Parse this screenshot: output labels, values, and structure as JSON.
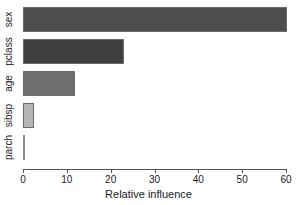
{
  "chart_data": {
    "type": "bar",
    "orientation": "horizontal",
    "title": "",
    "xlabel": "Relative influence",
    "ylabel": "",
    "categories": [
      "sex",
      "pclass",
      "age",
      "sibsp",
      "parch"
    ],
    "values": [
      60.3,
      23.0,
      11.9,
      2.5,
      0.3
    ],
    "series": [
      {
        "name": "Relative influence",
        "values": [
          60.3,
          23.0,
          11.9,
          2.5,
          0.3
        ]
      }
    ],
    "bar_colors": [
      "#4d4d4d",
      "#3f3f3f",
      "#6e6e6e",
      "#b5b5b5",
      "#8a8a8a"
    ],
    "bar_border_color": "#6b6b6b",
    "xlim": [
      0,
      60
    ],
    "xticks": [
      0,
      10,
      20,
      30,
      40,
      50,
      60
    ],
    "xtick_labels": [
      "0",
      "10",
      "20",
      "30",
      "40",
      "50",
      "60"
    ],
    "grid": false,
    "legend": false,
    "legend_position": "none",
    "background_color": "#ffffff",
    "axis_color": "#555555",
    "text_color": "#1a1a1a"
  },
  "axis": {
    "x_title": "Relative influence"
  },
  "bars": [
    {
      "label": "sex",
      "value": 60.3,
      "color": "#4d4d4d"
    },
    {
      "label": "pclass",
      "value": 23.0,
      "color": "#3f3f3f"
    },
    {
      "label": "age",
      "value": 11.9,
      "color": "#6e6e6e"
    },
    {
      "label": "sibsp",
      "value": 2.5,
      "color": "#b5b5b5"
    },
    {
      "label": "parch",
      "value": 0.3,
      "color": "#8a8a8a"
    }
  ],
  "ticks": [
    {
      "label": "0",
      "value": 0
    },
    {
      "label": "10",
      "value": 10
    },
    {
      "label": "20",
      "value": 20
    },
    {
      "label": "30",
      "value": 30
    },
    {
      "label": "40",
      "value": 40
    },
    {
      "label": "50",
      "value": 50
    },
    {
      "label": "60",
      "value": 60
    }
  ]
}
